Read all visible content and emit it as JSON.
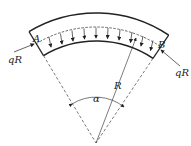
{
  "diagram": {
    "labels": {
      "point_a": "A",
      "point_b": "B",
      "force_left": "qR",
      "force_right": "qR",
      "radius": "R",
      "angle": "α"
    },
    "colors": {
      "line": "#222222",
      "background": "#ffffff"
    }
  }
}
